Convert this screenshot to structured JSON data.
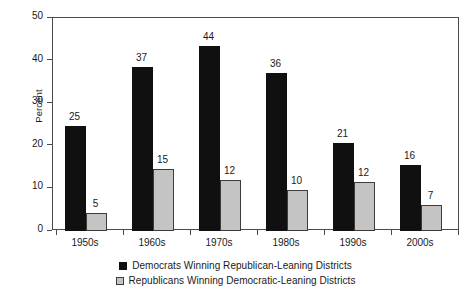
{
  "chart_data": {
    "type": "bar",
    "title": "",
    "subtitle": "",
    "xlabel": "",
    "ylabel": "Percent",
    "ylim": [
      0,
      50
    ],
    "yticks": [
      0,
      10,
      20,
      30,
      40,
      50
    ],
    "ytick_labels": [
      "0",
      "10",
      "20",
      "30",
      "40",
      "50"
    ],
    "grid": false,
    "legend_position": "bottom",
    "categories": [
      "1950s",
      "1960s",
      "1970s",
      "1980s",
      "1990s",
      "2000s"
    ],
    "series": [
      {
        "name": "Democrats Winning Republican-Leaning Districts",
        "color": "#101010",
        "values": [
          25,
          37,
          44,
          36,
          21,
          16
        ],
        "plotted_values": [
          24.6,
          38.5,
          43.4,
          37.0,
          20.6,
          15.4
        ],
        "labels": [
          "25",
          "37",
          "44",
          "36",
          "21",
          "16"
        ]
      },
      {
        "name": "Republicans Winning Democratic-Leaning Districts",
        "color": "#c4c4c4",
        "values": [
          5,
          15,
          12,
          10,
          12,
          7
        ],
        "plotted_values": [
          4.2,
          14.6,
          11.9,
          9.6,
          11.4,
          6.0
        ],
        "labels": [
          "5",
          "15",
          "12",
          "10",
          "12",
          "7"
        ]
      }
    ]
  },
  "legend": {
    "items": [
      {
        "label": "Democrats Winning Republican-Leaning Districts",
        "swatch": "dem"
      },
      {
        "label": "Republicans Winning Democratic-Leaning Districts",
        "swatch": "rep"
      }
    ]
  },
  "axis": {
    "y_title": "Percent"
  }
}
